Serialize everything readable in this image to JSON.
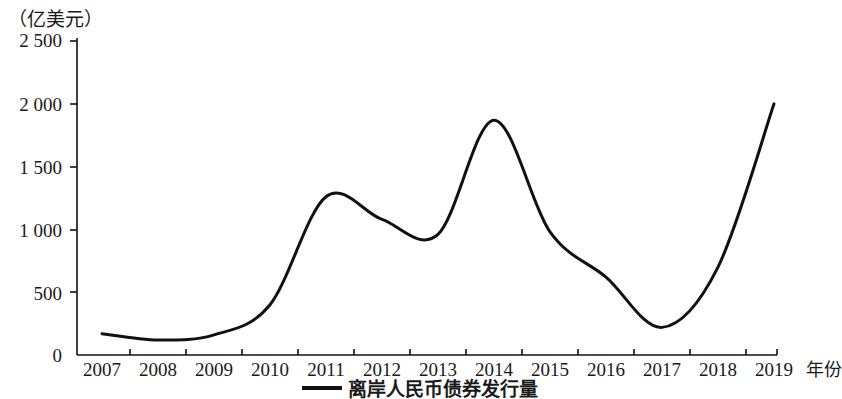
{
  "chart_data": {
    "type": "line",
    "title": "",
    "subtitle": "",
    "unit_label": "（亿美元）",
    "xlabel": "年份",
    "ylabel": "",
    "categories": [
      "2007",
      "2008",
      "2009",
      "2010",
      "2011",
      "2012",
      "2013",
      "2014",
      "2015",
      "2016",
      "2017",
      "2018",
      "2019"
    ],
    "series": [
      {
        "name": "离岸人民币债券发行量",
        "values": [
          170,
          120,
          160,
          400,
          1260,
          1080,
          960,
          1870,
          980,
          620,
          220,
          700,
          2000
        ],
        "color": "#111111"
      }
    ],
    "ylim": [
      0,
      2500
    ],
    "yticks": [
      0,
      500,
      1000,
      1500,
      2000,
      2500
    ],
    "ytick_labels": [
      "0",
      "500",
      "1 000",
      "1 500",
      "2 000",
      "2 500"
    ],
    "xtick_labels": [
      "2007",
      "2008",
      "2009",
      "2010",
      "2011",
      "2012",
      "2013",
      "2014",
      "2015",
      "2016",
      "2017",
      "2018",
      "2019"
    ],
    "grid": false,
    "legend": {
      "position": "bottom-center",
      "entries": [
        "离岸人民币债券发行量"
      ]
    },
    "axis_color": "#111111",
    "line_width": 3
  },
  "legend": {
    "label": "离岸人民币债券发行量"
  }
}
